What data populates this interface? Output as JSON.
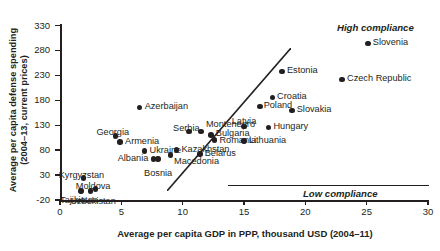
{
  "chart_data": {
    "type": "scatter",
    "title": "",
    "xlabel": "Average per capita GDP in PPP, thousand USD (2004–11)",
    "ylabel": "Average per capita defense spending (2004–13, current prices)",
    "xlim": [
      0,
      30
    ],
    "ylim": [
      -20,
      330
    ],
    "xticks": [
      0,
      5,
      10,
      15,
      20,
      25,
      30
    ],
    "yticks": [
      -20,
      30,
      80,
      130,
      180,
      230,
      280,
      330
    ],
    "grid": false,
    "legend": "none",
    "annotations": [
      {
        "text": "High compliance",
        "style": "bold-italic"
      },
      {
        "text": "Low compliance",
        "style": "bold-italic"
      }
    ],
    "points": [
      {
        "label": "Tajikistan",
        "x": 1.7,
        "y": -2,
        "lx": 1.55,
        "ly": -11,
        "anchor": "c"
      },
      {
        "label": "Kyrgyzstan",
        "x": 1.9,
        "y": 24,
        "lx": 1.75,
        "ly": 38,
        "anchor": "c"
      },
      {
        "label": "Uzbekistan",
        "x": 2.5,
        "y": -2,
        "lx": 2.7,
        "ly": -13,
        "anchor": "c"
      },
      {
        "label": "Moldova",
        "x": 2.9,
        "y": 2,
        "lx": 2.7,
        "ly": 16,
        "anchor": "c"
      },
      {
        "label": "Armenia",
        "x": 4.9,
        "y": 96,
        "lx": 5.3,
        "ly": 96,
        "anchor": "r"
      },
      {
        "label": "Georgia",
        "x": 4.5,
        "y": 108,
        "lx": 4.3,
        "ly": 124,
        "anchor": "c"
      },
      {
        "label": "Albania",
        "x": 7.6,
        "y": 62,
        "lx": 7.2,
        "ly": 62,
        "anchor": "l"
      },
      {
        "label": "Bosnia",
        "x": 8.0,
        "y": 62,
        "lx": 8.0,
        "ly": 42,
        "anchor": "c"
      },
      {
        "label": "Ukraine",
        "x": 6.9,
        "y": 78,
        "lx": 7.3,
        "ly": 78,
        "anchor": "r"
      },
      {
        "label": "Azerbaijan",
        "x": 6.5,
        "y": 166,
        "lx": 6.9,
        "ly": 166,
        "anchor": "r"
      },
      {
        "label": "Macedonia",
        "x": 9.0,
        "y": 70,
        "lx": 9.3,
        "ly": 56,
        "anchor": "r"
      },
      {
        "label": "Kazakhstan",
        "x": 9.5,
        "y": 80,
        "lx": 9.9,
        "ly": 80,
        "anchor": "r"
      },
      {
        "label": "Belarus",
        "x": 11.4,
        "y": 72,
        "lx": 11.8,
        "ly": 72,
        "anchor": "r"
      },
      {
        "label": "Serbia",
        "x": 10.5,
        "y": 118,
        "lx": 10.3,
        "ly": 132,
        "anchor": "c"
      },
      {
        "label": "Montenegro",
        "x": 11.5,
        "y": 118,
        "lx": 11.9,
        "ly": 130,
        "anchor": "r"
      },
      {
        "label": "Bulgaria",
        "x": 12.3,
        "y": 110,
        "lx": 12.7,
        "ly": 112,
        "anchor": "r"
      },
      {
        "label": "Romania",
        "x": 12.6,
        "y": 100,
        "lx": 13.0,
        "ly": 98,
        "anchor": "r"
      },
      {
        "label": "Lithuania",
        "x": 15.0,
        "y": 98,
        "lx": 15.4,
        "ly": 98,
        "anchor": "r"
      },
      {
        "label": "Latvia",
        "x": 15.0,
        "y": 128,
        "lx": 15.0,
        "ly": 146,
        "anchor": "c"
      },
      {
        "label": "Hungary",
        "x": 17.0,
        "y": 126,
        "lx": 17.4,
        "ly": 126,
        "anchor": "r"
      },
      {
        "label": "Poland",
        "x": 16.3,
        "y": 168,
        "lx": 16.6,
        "ly": 168,
        "anchor": "r"
      },
      {
        "label": "Croatia",
        "x": 17.3,
        "y": 186,
        "lx": 17.7,
        "ly": 186,
        "anchor": "r"
      },
      {
        "label": "Slovakia",
        "x": 18.9,
        "y": 160,
        "lx": 19.3,
        "ly": 160,
        "anchor": "r"
      },
      {
        "label": "Estonia",
        "x": 18.1,
        "y": 238,
        "lx": 18.5,
        "ly": 238,
        "anchor": "r"
      },
      {
        "label": "Czech Republic",
        "x": 23.0,
        "y": 222,
        "lx": 23.4,
        "ly": 222,
        "anchor": "r"
      },
      {
        "label": "Slovenia",
        "x": 25.1,
        "y": 294,
        "lx": 25.5,
        "ly": 294,
        "anchor": "r"
      }
    ]
  }
}
